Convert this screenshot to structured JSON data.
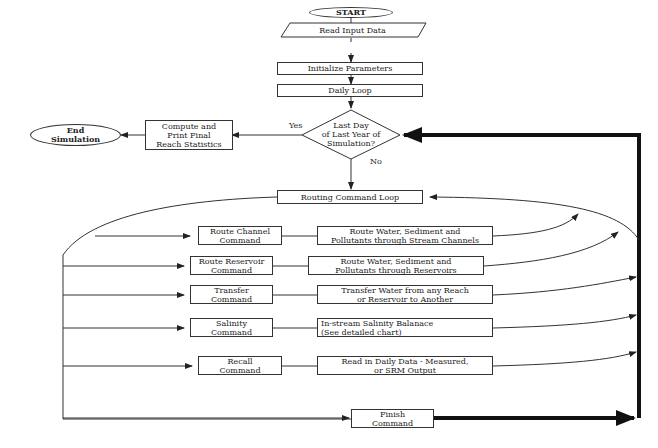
{
  "start": {
    "label": "START"
  },
  "read_input": {
    "label": "Read Input Data"
  },
  "init_params": {
    "label": "Initialize Parameters"
  },
  "daily_loop": {
    "label": "Daily Loop"
  },
  "decision": {
    "line1": "Last Day",
    "line2": "of Last Year of",
    "line3": "Simulation?",
    "yes_label": "Yes",
    "no_label": "No"
  },
  "compute": {
    "line1": "Compute and",
    "line2": "Print Final",
    "line3": "Reach Statistics"
  },
  "end": {
    "line1": "End",
    "line2": "Simulation"
  },
  "routing_loop": {
    "label": "Routing Command Loop"
  },
  "commands": [
    {
      "cmd_line1": "Route Channel",
      "cmd_line2": "Command",
      "desc_line1": "Route Water, Sediment and",
      "desc_line2": "Pollutants through Stream Channels"
    },
    {
      "cmd_line1": "Route Reservoir",
      "cmd_line2": "Command",
      "desc_line1": "Route Water, Sediment and",
      "desc_line2": "Pollutants through Reservoirs"
    },
    {
      "cmd_line1": "Transfer",
      "cmd_line2": "Command",
      "desc_line1": "Transfer Water from any Reach",
      "desc_line2": "or Reservoir to Another"
    },
    {
      "cmd_line1": "Salinity",
      "cmd_line2": "Command",
      "desc_line1": "In-stream Salinity Balanace",
      "desc_line2": "(See detailed chart)"
    },
    {
      "cmd_line1": "Recall",
      "cmd_line2": "Command",
      "desc_line1": "Read in Daily Data - Measured,",
      "desc_line2": "or SRM Output"
    }
  ],
  "finish": {
    "line1": "Finish",
    "line2": "Command"
  }
}
